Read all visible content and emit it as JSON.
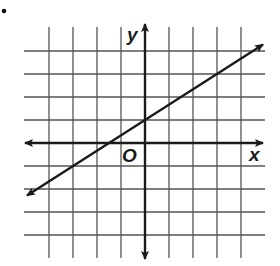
{
  "figure": {
    "bullet": "•",
    "axes": {
      "x_label": "x",
      "y_label": "y",
      "origin_label": "O"
    },
    "grid": {
      "x_min": -4,
      "x_max": 4,
      "y_min": -4,
      "y_max": 4,
      "step": 1
    },
    "line": {
      "equation": "y = (2/3)x + 1",
      "slope": 0.6667,
      "y_intercept": 1,
      "x_intercept": -1.5,
      "points": [
        [
          0,
          1
        ],
        [
          3,
          3
        ],
        [
          -1.5,
          0
        ]
      ],
      "arrows": "both"
    },
    "colors": {
      "grid": "#555555",
      "axes": "#1a1a1a",
      "line": "#1a1a1a",
      "background": "#ffffff"
    }
  }
}
